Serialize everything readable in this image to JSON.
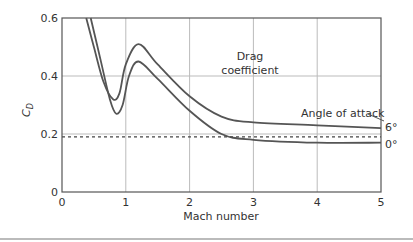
{
  "chart_data": {
    "type": "line",
    "title": "",
    "xlabel": "Mach number",
    "ylabel": "C_D",
    "ylabel_main": "C",
    "ylabel_sub": "D",
    "xlim": [
      0,
      5
    ],
    "ylim": [
      0,
      0.6
    ],
    "x_ticks": [
      "0",
      "1",
      "2",
      "3",
      "4",
      "5"
    ],
    "y_ticks": [
      "0",
      "0.2",
      "0.4",
      "0.6"
    ],
    "grid": true,
    "annotations": {
      "center": [
        "Drag",
        "coefficient"
      ],
      "legend_title": "Angle of attack"
    },
    "series": [
      {
        "name": "6°",
        "x": [
          0.38,
          0.5,
          0.65,
          0.8,
          0.9,
          1.0,
          1.2,
          1.5,
          2.0,
          2.5,
          3.0,
          4.0,
          5.0
        ],
        "y": [
          0.6,
          0.5,
          0.38,
          0.32,
          0.34,
          0.44,
          0.51,
          0.44,
          0.33,
          0.26,
          0.24,
          0.23,
          0.22
        ]
      },
      {
        "name": "0°",
        "x": [
          0.45,
          0.6,
          0.75,
          0.85,
          0.95,
          1.05,
          1.2,
          1.5,
          2.0,
          2.5,
          3.0,
          4.0,
          5.0
        ],
        "y": [
          0.6,
          0.46,
          0.32,
          0.27,
          0.3,
          0.4,
          0.45,
          0.39,
          0.28,
          0.2,
          0.18,
          0.17,
          0.17
        ]
      },
      {
        "name": "reference (dashed)",
        "x": [
          0,
          5
        ],
        "y": [
          0.19,
          0.19
        ]
      }
    ]
  }
}
